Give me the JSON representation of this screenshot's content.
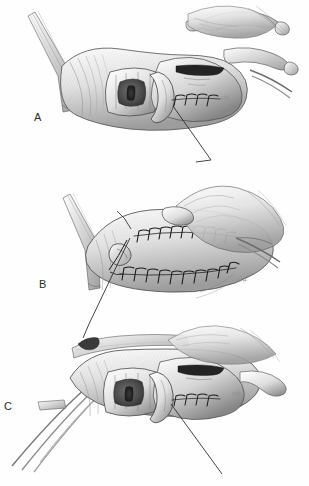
{
  "figure": {
    "style": "pen-and-ink medical illustration",
    "background_color": "#fefefe",
    "ink_color": "#2b2b2b",
    "shade_color": "#9a9a9a",
    "width": 309,
    "height": 486
  },
  "panels": [
    {
      "id": "A",
      "label": "A",
      "caption": "",
      "stage": "exposed lumen with partial suture row and retractor hooks",
      "suture_rows": 1,
      "stitch_count": 4,
      "leader_line": "from suture site extending down and to the right",
      "instruments": [
        "retractor-blade",
        "skin-hooks",
        "tissue-forceps"
      ],
      "signature": "sig."
    },
    {
      "id": "B",
      "label": "B",
      "caption": "",
      "stage": "closed segment with two parallel running suture lines and needle in place",
      "suture_rows": 2,
      "stitch_count": 19,
      "leader_line": "from needle site extending down and to the left",
      "instruments": [
        "curved-needle",
        "suture-thread",
        "retractor-blade",
        "tissue-forceps"
      ],
      "signature": "sig."
    },
    {
      "id": "C",
      "label": "C",
      "caption": "",
      "stage": "final exposure showing completed repair with flap in lumen",
      "suture_rows": 1,
      "stitch_count": 4,
      "leader_line": "from repair site extending down and to the right",
      "instruments": [
        "forceps-tines",
        "retractor-blade"
      ],
      "signature": "sig."
    }
  ],
  "labels": {
    "a": "A",
    "b": "B",
    "c": "C"
  }
}
